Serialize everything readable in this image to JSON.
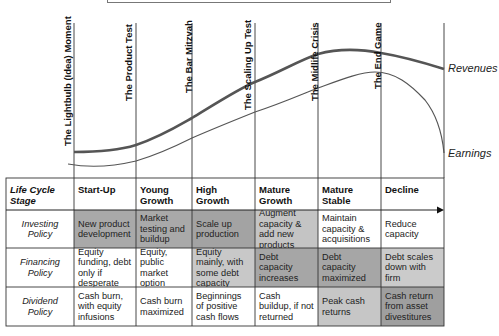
{
  "milestones": [
    {
      "label": "The Lightbulb (Idea) Moment",
      "x": 74
    },
    {
      "label": "The Product Test",
      "x": 136
    },
    {
      "label": "The Bar Mitzvah",
      "x": 192
    },
    {
      "label": "The Scaling Up Test",
      "x": 255
    },
    {
      "label": "The Midlife Crisis",
      "x": 318
    },
    {
      "label": "The End Game",
      "x": 381
    }
  ],
  "curves": {
    "revenues_label": "Revenues",
    "earnings_label": "Earnings"
  },
  "table": {
    "stage_header": "Life Cycle Stage",
    "stages": [
      "Start-Up",
      "Young Growth",
      "High Growth",
      "Mature Growth",
      "Mature Stable",
      "Decline"
    ],
    "rows": [
      {
        "label": "Investing Policy",
        "cells": [
          "New product development",
          "Market testing and buildup",
          "Scale up production",
          "Augment capacity & add new products",
          "Maintain capacity & acquisitions",
          "Reduce capacity"
        ],
        "shades": [
          "#a9a9a9",
          "#a9a9a9",
          "#a3a3a3",
          "#c4c4c4",
          "#ffffff",
          "#ffffff"
        ]
      },
      {
        "label": "Financing Policy",
        "cells": [
          "Equity funding, debt only if desperate",
          "Equity, public market option",
          "Equity mainly, with some debt capacity",
          "Debt capacity increases",
          "Debt capacity maximized",
          "Debt scales down with firm"
        ],
        "shades": [
          "#ffffff",
          "#ffffff",
          "#c8c8c8",
          "#a6a6a6",
          "#a6a6a6",
          "#cbcbcb"
        ]
      },
      {
        "label": "Dividend Policy",
        "cells": [
          "Cash burn, with equity infusions",
          "Cash burn maximized",
          "Beginnings of positive cash flows",
          "Cash buildup, if not returned",
          "Peak cash returns",
          "Cash return from asset divestitures"
        ],
        "shades": [
          "#ffffff",
          "#ffffff",
          "#ffffff",
          "#ffffff",
          "#c6c6c6",
          "#9f9f9f"
        ]
      }
    ]
  }
}
